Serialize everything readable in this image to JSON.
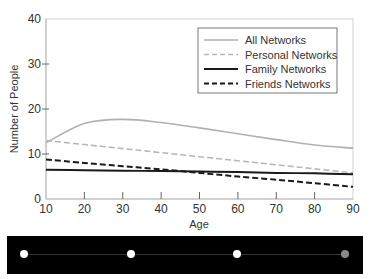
{
  "chart_data": {
    "type": "line",
    "title": "",
    "xlabel": "Age",
    "ylabel": "Number of People",
    "xlim": [
      10,
      90
    ],
    "ylim": [
      0,
      40
    ],
    "x_ticks": [
      10,
      20,
      30,
      40,
      50,
      60,
      70,
      80,
      90
    ],
    "y_ticks": [
      0,
      10,
      20,
      30,
      40
    ],
    "grid": false,
    "legend_position": "upper right",
    "x": [
      10,
      20,
      30,
      40,
      50,
      60,
      70,
      80,
      90
    ],
    "series": [
      {
        "name": "All Networks",
        "style": "solid",
        "color": "#b0b0b0",
        "values": [
          12.5,
          16.8,
          17.7,
          17.0,
          15.8,
          14.5,
          13.2,
          12.0,
          11.3
        ]
      },
      {
        "name": "Personal Networks",
        "style": "dashed",
        "color": "#b8b8b8",
        "values": [
          13.0,
          12.1,
          11.2,
          10.3,
          9.4,
          8.5,
          7.6,
          6.7,
          5.8
        ]
      },
      {
        "name": "Family Networks",
        "style": "solid",
        "color": "#1a1a1a",
        "values": [
          6.5,
          6.4,
          6.3,
          6.2,
          6.1,
          6.0,
          5.8,
          5.7,
          5.5
        ]
      },
      {
        "name": "Friends Networks",
        "style": "dashed",
        "color": "#1a1a1a",
        "values": [
          8.8,
          8.0,
          7.3,
          6.6,
          5.8,
          5.0,
          4.3,
          3.5,
          2.7
        ]
      }
    ]
  },
  "axes": {
    "xlabel": "Age",
    "ylabel": "Number of People",
    "x_tick_labels": [
      "10",
      "20",
      "30",
      "40",
      "50",
      "60",
      "70",
      "80",
      "90"
    ],
    "y_tick_labels": [
      "0",
      "10",
      "20",
      "30",
      "40"
    ]
  },
  "legend": {
    "items": [
      {
        "label": "All Networks"
      },
      {
        "label": "Personal Networks"
      },
      {
        "label": "Family Networks"
      },
      {
        "label": "Friends Networks"
      }
    ]
  },
  "navigator": {
    "dots": [
      {
        "state": "active"
      },
      {
        "state": "active"
      },
      {
        "state": "active"
      },
      {
        "state": "inactive"
      }
    ]
  }
}
